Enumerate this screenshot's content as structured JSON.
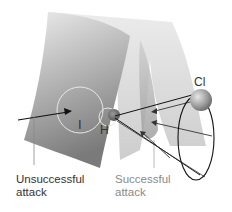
{
  "diagram": {
    "labels": {
      "I": "I",
      "H": "H",
      "Cl": "Cl",
      "unsuccessful_line1": "Unsuccessful",
      "unsuccessful_line2": "attack",
      "successful_line1": "Successful",
      "successful_line2": "attack"
    },
    "colors": {
      "surface_light": "#e6e6e6",
      "surface_mid": "#bdbdbd",
      "surface_dark": "#7d7d7d",
      "back_sheet": "#cfcfcf",
      "valley": "#9a9a9a",
      "ring": "#e8e8e8",
      "sphere_cl": "#9e9e9e",
      "sphere_h": "#6e6e6e",
      "lines": "#222222",
      "text_dark": "#333333",
      "text_light": "#8a8a8a"
    }
  }
}
